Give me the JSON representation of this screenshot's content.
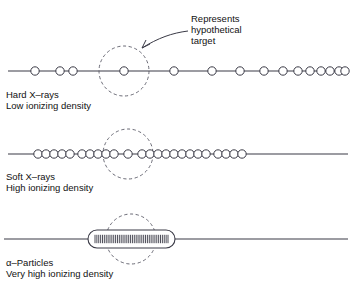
{
  "diagram": {
    "title_annotation": {
      "lines": [
        "Represents",
        "hypothetical",
        "target"
      ],
      "line1": "Represents",
      "line2": "hypothetical",
      "line3": "target"
    },
    "colors": {
      "line": "#3a3a46",
      "circle_stroke": "#3a3a46",
      "dashed_target": "#5a5a66",
      "text": "#111111",
      "background": "#ffffff"
    },
    "tracks": [
      {
        "id": "hard-xrays",
        "name_line1": "Hard X–rays",
        "name_line2": "Low ionizing density",
        "ionizing_density": "Low",
        "baseline_y": 71,
        "line_x1": 8,
        "line_x2": 348,
        "circle_radius": 4.2,
        "target_circle": {
          "cx": 124,
          "cy": 71,
          "r": 25
        },
        "ion_positions": [
          35,
          60,
          73,
          124,
          174,
          212,
          240,
          264,
          283,
          298,
          310,
          321,
          330,
          339,
          345
        ]
      },
      {
        "id": "soft-xrays",
        "name_line1": "Soft X–rays",
        "name_line2": "High ionizing density",
        "ionizing_density": "High",
        "baseline_y": 154,
        "line_x1": 8,
        "line_x2": 348,
        "circle_radius": 4.2,
        "target_circle": {
          "cx": 128,
          "cy": 154,
          "r": 25
        },
        "ion_positions": [
          38,
          46,
          54,
          62,
          70,
          82,
          90,
          98,
          106,
          114,
          128,
          142,
          150,
          158,
          166,
          174,
          182,
          190,
          198,
          206,
          218,
          226,
          234,
          242
        ]
      },
      {
        "id": "alpha-particles",
        "name_line1": "α–Particles",
        "name_line2": "Very high ionizing density",
        "ionizing_density": "Very high",
        "baseline_y": 239,
        "line_x1": 4,
        "line_x2": 348,
        "target_circle": {
          "cx": 131,
          "cy": 239,
          "r": 25
        },
        "capsule": {
          "x1": 88,
          "x2": 175,
          "half_height": 9,
          "tick_count": 40
        }
      }
    ]
  }
}
